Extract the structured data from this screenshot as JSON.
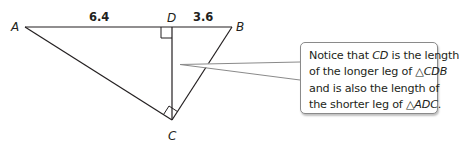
{
  "diagram": {
    "points": {
      "A": {
        "label": "A",
        "x": 25,
        "y": 27
      },
      "D": {
        "label": "D",
        "x": 172,
        "y": 27
      },
      "B": {
        "label": "B",
        "x": 232,
        "y": 27
      },
      "C": {
        "label": "C",
        "x": 172,
        "y": 120
      }
    },
    "segments": [
      {
        "from": "A",
        "to": "B"
      },
      {
        "from": "A",
        "to": "C"
      },
      {
        "from": "B",
        "to": "C"
      },
      {
        "from": "D",
        "to": "C"
      }
    ],
    "right_angles": [
      "D",
      "C"
    ],
    "measurements": {
      "AD": "6.4",
      "DB": "3.6"
    },
    "colors": {
      "stroke": "#231f20",
      "callout_border": "#8a8a8a",
      "background": "#ffffff"
    }
  },
  "callout": {
    "lines": [
      {
        "parts": [
          {
            "text": "Notice that ",
            "italic": false
          },
          {
            "text": "CD",
            "italic": true
          },
          {
            "text": " is the length",
            "italic": false
          }
        ]
      },
      {
        "parts": [
          {
            "text": "of the longer leg of ",
            "italic": false
          },
          {
            "text": "△",
            "italic": false
          },
          {
            "text": "CDB",
            "italic": true
          }
        ]
      },
      {
        "parts": [
          {
            "text": "and is also the length of",
            "italic": false
          }
        ]
      },
      {
        "parts": [
          {
            "text": "the shorter leg of ",
            "italic": false
          },
          {
            "text": "△",
            "italic": false
          },
          {
            "text": "ADC",
            "italic": true
          },
          {
            "text": ".",
            "italic": false
          }
        ]
      }
    ]
  }
}
